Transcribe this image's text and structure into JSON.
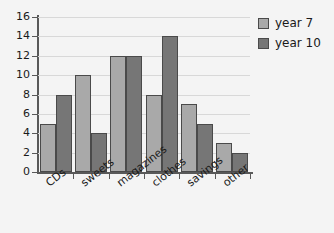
{
  "chart_data": {
    "type": "bar",
    "title": "",
    "subtitle": "",
    "xlabel": "",
    "ylabel": "",
    "categories": [
      "CDs",
      "sweets",
      "magazines",
      "clothes",
      "savings",
      "other"
    ],
    "series": [
      {
        "name": "year 7",
        "color": "#a9a9a9",
        "values": [
          5,
          10,
          12,
          8,
          7,
          3
        ]
      },
      {
        "name": "year 10",
        "color": "#767676",
        "values": [
          8,
          4,
          12,
          14,
          5,
          2
        ]
      }
    ],
    "ylim": [
      0,
      16
    ],
    "ytick_step": 2,
    "yticks": [
      0,
      2,
      4,
      6,
      8,
      10,
      12,
      14,
      16
    ],
    "ytick_labels": [
      "0",
      "2",
      "4",
      "6",
      "8",
      "10",
      "12",
      "14",
      "16"
    ],
    "grid": true,
    "grid_axis": "y",
    "legend_position": "top-right",
    "orientation": "vertical",
    "grouping": "grouped",
    "xtick_label_rotation": -38,
    "background_color": "#f4f4f4",
    "axis_color": "#595959",
    "grid_color": "#d8d8d8",
    "bar_edge_color": "#4a4a4a"
  }
}
